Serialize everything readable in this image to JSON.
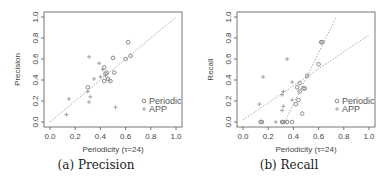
{
  "chart_data": [
    {
      "type": "scatter",
      "title": "",
      "caption": "(a) Precision",
      "xlabel": "Periodicity (τ=24)",
      "ylabel": "Precision",
      "xlim": [
        0,
        1
      ],
      "ylim": [
        0,
        1
      ],
      "xticks": [
        "0.0",
        "0.2",
        "0.4",
        "0.6",
        "0.8",
        "1.0"
      ],
      "yticks": [
        "0.0",
        "0.2",
        "0.4",
        "0.6",
        "0.8",
        "1.0"
      ],
      "grid": false,
      "legend": {
        "position": "bottom-right",
        "entries": [
          "Periodic",
          "APP"
        ]
      },
      "series": [
        {
          "name": "Periodic",
          "marker": "circle",
          "points": [
            [
              0.62,
              0.76
            ],
            [
              0.64,
              0.63
            ],
            [
              0.6,
              0.6
            ],
            [
              0.5,
              0.61
            ],
            [
              0.51,
              0.47
            ],
            [
              0.43,
              0.52
            ],
            [
              0.45,
              0.47
            ],
            [
              0.44,
              0.46
            ],
            [
              0.46,
              0.41
            ],
            [
              0.48,
              0.39
            ],
            [
              0.43,
              0.39
            ],
            [
              0.3,
              0.33
            ]
          ]
        },
        {
          "name": "APP",
          "marker": "plus",
          "points": [
            [
              0.31,
              0.62
            ],
            [
              0.39,
              0.56
            ],
            [
              0.4,
              0.43
            ],
            [
              0.35,
              0.41
            ],
            [
              0.42,
              0.5
            ],
            [
              0.44,
              0.44
            ],
            [
              0.47,
              0.4
            ],
            [
              0.3,
              0.29
            ],
            [
              0.32,
              0.24
            ],
            [
              0.31,
              0.19
            ],
            [
              0.15,
              0.22
            ],
            [
              0.13,
              0.07
            ],
            [
              0.52,
              0.14
            ]
          ]
        }
      ],
      "reference_lines": [
        {
          "kind": "diagonal",
          "from": [
            0,
            0
          ],
          "to": [
            1,
            1
          ],
          "style": "dotted"
        }
      ]
    },
    {
      "type": "scatter",
      "title": "",
      "caption": "(b) Recall",
      "xlabel": "Periodicity (τ=24)",
      "ylabel": "Recall",
      "xlim": [
        0,
        1
      ],
      "ylim": [
        0,
        1
      ],
      "xticks": [
        "0.0",
        "0.2",
        "0.4",
        "0.6",
        "0.8",
        "1.0"
      ],
      "yticks": [
        "0.0",
        "0.2",
        "0.4",
        "0.6",
        "0.8",
        "1.0"
      ],
      "grid": false,
      "legend": {
        "position": "bottom-right",
        "entries": [
          "Periodic",
          "APP"
        ]
      },
      "series": [
        {
          "name": "Periodic",
          "marker": "circle",
          "points": [
            [
              0.62,
              0.76
            ],
            [
              0.63,
              0.76
            ],
            [
              0.6,
              0.55
            ],
            [
              0.51,
              0.44
            ],
            [
              0.45,
              0.37
            ],
            [
              0.49,
              0.32
            ],
            [
              0.48,
              0.32
            ],
            [
              0.43,
              0.33
            ],
            [
              0.45,
              0.29
            ],
            [
              0.44,
              0.21
            ],
            [
              0.42,
              0.17
            ],
            [
              0.47,
              0.08
            ],
            [
              0.39,
              0.0
            ],
            [
              0.32,
              0.0
            ],
            [
              0.31,
              0.0
            ],
            [
              0.14,
              0.0
            ],
            [
              0.15,
              0.0
            ],
            [
              0.35,
              0.0
            ]
          ]
        },
        {
          "name": "APP",
          "marker": "plus",
          "points": [
            [
              0.35,
              0.6
            ],
            [
              0.16,
              0.43
            ],
            [
              0.39,
              0.38
            ],
            [
              0.32,
              0.29
            ],
            [
              0.31,
              0.26
            ],
            [
              0.39,
              0.21
            ],
            [
              0.32,
              0.15
            ],
            [
              0.31,
              0.11
            ],
            [
              0.13,
              0.17
            ],
            [
              0.26,
              0.0
            ],
            [
              0.33,
              0.0
            ]
          ]
        }
      ],
      "reference_lines": [
        {
          "kind": "fit",
          "series": "APP",
          "from": [
            0.0,
            0.02
          ],
          "to": [
            1.0,
            0.83
          ],
          "style": "dotted"
        },
        {
          "kind": "fit",
          "series": "Periodic",
          "from": [
            0.33,
            0.0
          ],
          "to": [
            0.74,
            1.0
          ],
          "style": "dotted"
        }
      ]
    }
  ],
  "figure": {
    "panel_a": {
      "caption": "(a) Precision",
      "ylabel": "Precision",
      "xlabel": "Periodicity (τ=24)"
    },
    "panel_b": {
      "caption": "(b) Recall",
      "ylabel": "Recall",
      "xlabel": "Periodicity (τ=24)"
    },
    "legend": {
      "periodic": "Periodic",
      "app": "APP"
    },
    "colors": {
      "periodic": "#8a8a8a",
      "app": "#9a9a9a",
      "axis": "#555555",
      "line": "#aaaaaa"
    }
  }
}
